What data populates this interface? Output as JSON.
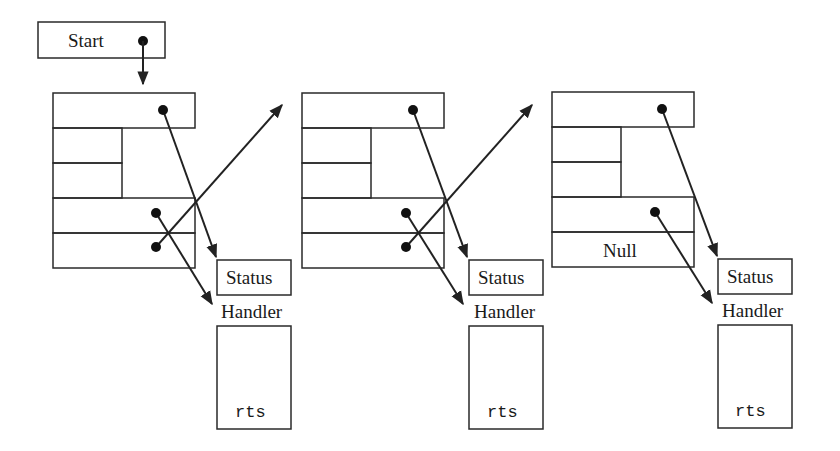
{
  "diagram": {
    "start_label": "Start",
    "colors": {
      "stroke": "#222222",
      "text": "#1a1a1a",
      "background": "#ffffff"
    },
    "frames": [
      {
        "id": "frame-1",
        "fields": [
          "",
          "",
          "",
          "",
          ""
        ],
        "status_label": "Status",
        "handler_label": "Handler",
        "routine_text": "rts"
      },
      {
        "id": "frame-2",
        "fields": [
          "",
          "",
          "",
          "",
          ""
        ],
        "status_label": "Status",
        "handler_label": "Handler",
        "routine_text": "rts"
      },
      {
        "id": "frame-3",
        "fields": [
          "",
          "",
          "",
          "",
          "Null"
        ],
        "status_label": "Status",
        "handler_label": "Handler",
        "routine_text": "rts"
      }
    ]
  }
}
